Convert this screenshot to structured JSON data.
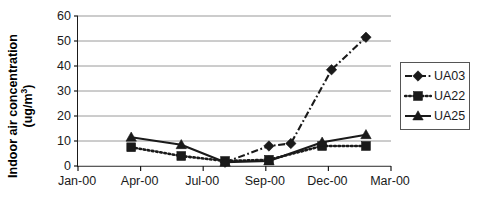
{
  "chart_data": {
    "type": "line",
    "title": "",
    "xlabel": "",
    "ylabel_line1": "Indoor air concentration",
    "ylabel_line2": "(ug/m",
    "ylabel_exponent": "3",
    "ylabel_line2_tail": ")",
    "ylabel": "Indoor air concentration (ug/m3)",
    "categories": [
      "Jan-00",
      "Apr-00",
      "Jul-00",
      "Sep-00",
      "Dec-00",
      "Mar-00"
    ],
    "xtick_labels": [
      "Jan-00",
      "Apr-00",
      "Jul-00",
      "Sep-00",
      "Dec-00",
      "Mar-00"
    ],
    "ytick_labels": [
      "0",
      "10",
      "20",
      "30",
      "40",
      "50",
      "60"
    ],
    "ytick_values": [
      0,
      10,
      20,
      30,
      40,
      50,
      60
    ],
    "ylim": [
      0,
      60
    ],
    "xlim": [
      0,
      5
    ],
    "grid": "horizontal",
    "legend_position": "right",
    "series": [
      {
        "name": "UA03",
        "marker": "diamond",
        "linestyle": "dash-dot",
        "color": "#1a1a1a",
        "x": [
          2.35,
          3.05,
          3.4,
          4.05,
          4.6
        ],
        "values": [
          1.5,
          8.0,
          9.0,
          38.5,
          51.5
        ]
      },
      {
        "name": "UA22",
        "marker": "square",
        "linestyle": "dotted",
        "color": "#1a1a1a",
        "x": [
          0.85,
          1.65,
          2.35,
          3.05,
          3.9,
          4.6
        ],
        "values": [
          7.5,
          4.0,
          2.0,
          2.5,
          8.0,
          8.0
        ]
      },
      {
        "name": "UA25",
        "marker": "triangle",
        "linestyle": "solid",
        "color": "#1a1a1a",
        "x": [
          0.85,
          1.65,
          2.35,
          3.05,
          3.9,
          4.6
        ],
        "values": [
          11.5,
          8.5,
          1.5,
          2.0,
          9.5,
          12.5
        ]
      }
    ]
  },
  "legend": {
    "entries": [
      {
        "label": "UA03"
      },
      {
        "label": "UA22"
      },
      {
        "label": "UA25"
      }
    ]
  },
  "colors": {
    "axis": "#1a1a1a",
    "grid": "#9a9a9a",
    "series": "#1a1a1a",
    "legend_border": "#555555",
    "background": "#ffffff"
  }
}
